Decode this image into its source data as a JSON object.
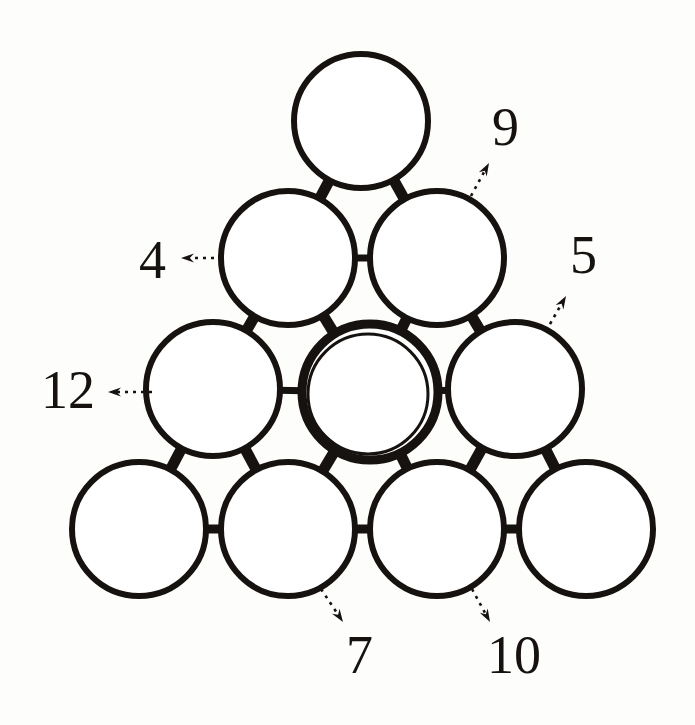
{
  "figure": {
    "background_color": "#fdfdfb",
    "stroke_color": "#16120f",
    "canvas": {
      "width": 695,
      "height": 725
    }
  },
  "circles": [
    {
      "id": "r1c1",
      "name": "top-circle",
      "cx": 361,
      "cy": 121,
      "r": 67,
      "stroke_width": 6,
      "highlighted": false
    },
    {
      "id": "r2c1",
      "name": "row2-left-circle",
      "cx": 288,
      "cy": 258,
      "r": 67,
      "stroke_width": 6,
      "highlighted": false
    },
    {
      "id": "r2c2",
      "name": "row2-right-circle",
      "cx": 437,
      "cy": 258,
      "r": 67,
      "stroke_width": 6,
      "highlighted": false
    },
    {
      "id": "r3c1",
      "name": "row3-left-circle",
      "cx": 213,
      "cy": 389,
      "r": 67,
      "stroke_width": 6,
      "highlighted": false
    },
    {
      "id": "r3c2",
      "name": "row3-center-circle",
      "cx": 370,
      "cy": 392,
      "r": 68,
      "stroke_width": 9,
      "highlighted": true
    },
    {
      "id": "r3c3",
      "name": "row3-right-circle",
      "cx": 515,
      "cy": 389,
      "r": 67,
      "stroke_width": 6,
      "highlighted": false
    },
    {
      "id": "r4c1",
      "name": "row4-circle-1",
      "cx": 139,
      "cy": 529,
      "r": 67,
      "stroke_width": 6,
      "highlighted": false
    },
    {
      "id": "r4c2",
      "name": "row4-circle-2",
      "cx": 288,
      "cy": 529,
      "r": 67,
      "stroke_width": 6,
      "highlighted": false
    },
    {
      "id": "r4c3",
      "name": "row4-circle-3",
      "cx": 437,
      "cy": 529,
      "r": 67,
      "stroke_width": 6,
      "highlighted": false
    },
    {
      "id": "r4c4",
      "name": "row4-circle-4",
      "cx": 586,
      "cy": 529,
      "r": 67,
      "stroke_width": 6,
      "highlighted": false
    }
  ],
  "bonds": [
    {
      "name": "bond-top-to-row2-left",
      "from": "r1c1",
      "to": "r2c1",
      "width": 11
    },
    {
      "name": "bond-top-to-row2-right",
      "from": "r1c1",
      "to": "r2c2",
      "width": 11
    },
    {
      "name": "bond-row2-left-to-row2-right",
      "from": "r2c1",
      "to": "r2c2",
      "width": 7
    },
    {
      "name": "bond-row2-left-to-row3-left",
      "from": "r2c1",
      "to": "r3c1",
      "width": 11
    },
    {
      "name": "bond-row2-left-to-row3-center",
      "from": "r2c1",
      "to": "r3c2",
      "width": 11
    },
    {
      "name": "bond-row2-right-to-row3-center",
      "from": "r2c2",
      "to": "r3c2",
      "width": 11
    },
    {
      "name": "bond-row2-right-to-row3-right",
      "from": "r2c2",
      "to": "r3c3",
      "width": 11
    },
    {
      "name": "bond-row3-left-to-row3-center",
      "from": "r3c1",
      "to": "r3c2",
      "width": 7
    },
    {
      "name": "bond-row3-center-to-row3-right",
      "from": "r3c2",
      "to": "r3c3",
      "width": 7
    },
    {
      "name": "bond-row3-left-to-row4-1",
      "from": "r3c1",
      "to": "r4c1",
      "width": 11
    },
    {
      "name": "bond-row3-left-to-row4-2",
      "from": "r3c1",
      "to": "r4c2",
      "width": 11
    },
    {
      "name": "bond-row3-center-to-row4-2",
      "from": "r3c2",
      "to": "r4c2",
      "width": 11
    },
    {
      "name": "bond-row3-center-to-row4-3",
      "from": "r3c2",
      "to": "r4c3",
      "width": 11
    },
    {
      "name": "bond-row3-right-to-row4-3",
      "from": "r3c3",
      "to": "r4c3",
      "width": 11
    },
    {
      "name": "bond-row3-right-to-row4-4",
      "from": "r3c3",
      "to": "r4c4",
      "width": 11
    },
    {
      "name": "bond-row4-1-to-row4-2",
      "from": "r4c1",
      "to": "r4c2",
      "width": 9
    },
    {
      "name": "bond-row4-2-to-row4-3",
      "from": "r4c2",
      "to": "r4c3",
      "width": 9
    },
    {
      "name": "bond-row4-3-to-row4-4",
      "from": "r4c3",
      "to": "r4c4",
      "width": 9
    }
  ],
  "labels": [
    {
      "id": "label-9",
      "text": "9",
      "x": 492,
      "y": 100,
      "target": "r2c2",
      "arrow": {
        "x1": 471,
        "y1": 196,
        "x2": 489,
        "y2": 163
      }
    },
    {
      "id": "label-4",
      "text": "4",
      "x": 139,
      "y": 233,
      "target": "r2c1",
      "arrow": {
        "x1": 222,
        "y1": 258,
        "x2": 181,
        "y2": 258
      }
    },
    {
      "id": "label-5",
      "text": "5",
      "x": 570,
      "y": 228,
      "target": "r3c3",
      "arrow": {
        "x1": 546,
        "y1": 331,
        "x2": 566,
        "y2": 296
      }
    },
    {
      "id": "label-12",
      "text": "12",
      "x": 41,
      "y": 363,
      "target": "r3c1",
      "arrow": {
        "x1": 152,
        "y1": 392,
        "x2": 108,
        "y2": 392
      }
    },
    {
      "id": "label-7",
      "text": "7",
      "x": 346,
      "y": 628,
      "target": "r4c2",
      "arrow": {
        "x1": 321,
        "y1": 589,
        "x2": 343,
        "y2": 622
      }
    },
    {
      "id": "label-10",
      "text": "10",
      "x": 487,
      "y": 628,
      "target": "r4c3",
      "arrow": {
        "x1": 472,
        "y1": 589,
        "x2": 490,
        "y2": 622
      }
    }
  ],
  "arrow_style": {
    "dash_pattern": "3 5",
    "stroke_width": 2.6,
    "head_length": 13,
    "head_width": 9
  }
}
